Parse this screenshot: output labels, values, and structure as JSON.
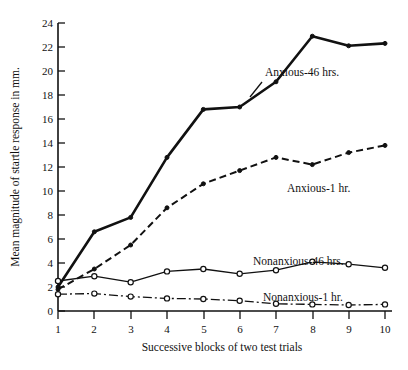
{
  "chart_data": {
    "type": "line",
    "title": "",
    "xlabel": "Successive blocks of two test trials",
    "ylabel": "Mean magnitude of startle response in mm.",
    "x": [
      1,
      2,
      3,
      4,
      5,
      6,
      7,
      8,
      9,
      10
    ],
    "xtick_labels": [
      "1",
      "2",
      "3",
      "4",
      "5",
      "6",
      "7",
      "8",
      "9",
      "10"
    ],
    "ytick_labels": [
      "0",
      "2",
      "4",
      "6",
      "8",
      "10",
      "12",
      "14",
      "16",
      "18",
      "20",
      "22",
      "24"
    ],
    "ytick_values": [
      0,
      2,
      4,
      6,
      8,
      10,
      12,
      14,
      16,
      18,
      20,
      22,
      24
    ],
    "xlim": [
      1,
      10
    ],
    "ylim": [
      0,
      24
    ],
    "grid": false,
    "legend_position": "inline-annotations",
    "series": [
      {
        "name": "Anxious-46 hrs.",
        "label": "Anxious-46 hrs.",
        "style": "thick-solid",
        "marker": "filled-circle",
        "values": [
          2.0,
          6.6,
          7.8,
          12.8,
          16.8,
          17.0,
          19.1,
          22.9,
          22.1,
          22.3
        ]
      },
      {
        "name": "Anxious-1 hr.",
        "label": "Anxious-1 hr.",
        "style": "dashed",
        "marker": "filled-circle",
        "values": [
          1.8,
          3.5,
          5.5,
          8.6,
          10.6,
          11.7,
          12.8,
          12.2,
          13.2,
          13.8
        ]
      },
      {
        "name": "Nonanxious-46 hrs.",
        "label": "Nonanxious-46 hrs.",
        "style": "thin-solid",
        "marker": "open-circle",
        "values": [
          2.5,
          2.9,
          2.4,
          3.3,
          3.5,
          3.1,
          3.4,
          4.1,
          3.9,
          3.6
        ]
      },
      {
        "name": "Nonanxious-1 hr.",
        "label": "Nonanxious-1 hr.",
        "style": "dash-dot",
        "marker": "open-circle",
        "values": [
          1.4,
          1.45,
          1.2,
          1.05,
          1.0,
          0.85,
          0.6,
          0.55,
          0.5,
          0.55
        ]
      }
    ],
    "annotations": [
      {
        "text": "Anxious-46 hrs.",
        "x_px": 265,
        "y_px": 76
      },
      {
        "text": "Anxious-1 hr.",
        "x_px": 287,
        "y_px": 192
      },
      {
        "text": "Nonanxious-46 hrs.",
        "x_px": 253,
        "y_px": 265
      },
      {
        "text": "Nonanxious-1 hr.",
        "x_px": 263,
        "y_px": 301
      }
    ],
    "colors": {
      "ink": "#111111",
      "background": "#ffffff"
    }
  }
}
